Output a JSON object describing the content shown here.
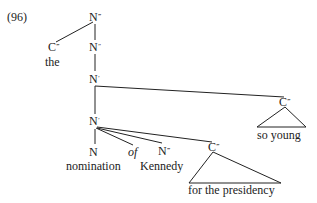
{
  "example_number": "(96)",
  "tree": {
    "root": {
      "label": "N",
      "bars": "‴"
    },
    "specifier": {
      "label": "C",
      "bars": "‴",
      "word": "the"
    },
    "n2": {
      "label": "N",
      "bars": "″"
    },
    "n1_upper": {
      "label": "N",
      "bars": "′"
    },
    "right_adjunct": {
      "label": "C",
      "bars": "‴",
      "phrase": "so young"
    },
    "n1_lower": {
      "label": "N",
      "bars": "′"
    },
    "head": {
      "label": "N",
      "bars": "",
      "word": "nomination"
    },
    "preposition": {
      "word": "of"
    },
    "complement": {
      "label": "N",
      "bars": "‴",
      "word": "Kennedy"
    },
    "pp_adjunct": {
      "label": "C",
      "bars": "‴",
      "phrase": "for the presidency"
    }
  }
}
